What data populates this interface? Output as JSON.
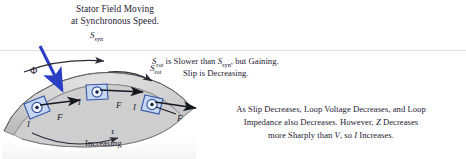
{
  "figure": {
    "title_block": {
      "line1": "Stator Field Moving",
      "line2": "at Synchronous Speed."
    },
    "labels": {
      "s_syn_top": {
        "base": "S",
        "sub": "syn"
      },
      "s_rot_arrow": {
        "base": "S",
        "sub": "rot"
      },
      "flux": "Φ",
      "torque": "τ",
      "torque_caption": "Increasing",
      "current_1": "I",
      "current_2": "I",
      "current_3": "I",
      "force_1": "F",
      "force_2": "F",
      "force_3": "F"
    },
    "annotation_slip": {
      "line1_part1": "S",
      "line1_sub1": "rot",
      "line1_part2": " is Slower than ",
      "line1_part3": "S",
      "line1_sub2": "syn",
      "line1_part4": ", but Gaining.",
      "line2": "Slip is Decreasing."
    },
    "annotation_current": {
      "line1": "As Slip Decreases, Loop Voltage Decreases, and Loop",
      "line2_part1": "Impedance also Decreases. However, ",
      "line2_italic": "Z",
      "line2_part2": " Decreases",
      "line3_part1": "more Sharply than ",
      "line3_italic1": "V",
      "line3_part2": ", so ",
      "line3_italic2": "I",
      "line3_part3": " Increases."
    },
    "colors": {
      "flux_arrow": "#2b3fc4",
      "conductor_outline": "#3355aa",
      "conductor_fill": "#c8d8ee",
      "rotor_fill": "#d3d3d3",
      "rotor_stroke": "#5c5c5c",
      "arrow_dark": "#16161e",
      "rule": "#d7d7dd",
      "text": "#1e2030"
    }
  }
}
